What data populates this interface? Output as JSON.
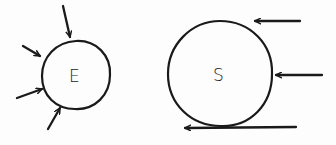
{
  "diagram": {
    "nodes": [
      {
        "id": "E",
        "label": "E",
        "cx": 76,
        "cy": 75,
        "r": 34,
        "incoming_arrows": 4,
        "arrow_direction": "inward from various directions (top, upper-left, left, lower-left)"
      },
      {
        "id": "S",
        "label": "S",
        "cx": 220,
        "cy": 74,
        "r": 52,
        "incoming_arrows": 3,
        "arrow_direction": "from the right, leftward"
      }
    ],
    "arrows": [
      {
        "target": "E",
        "x1": 63,
        "y1": 6,
        "x2": 70,
        "y2": 37
      },
      {
        "target": "E",
        "x1": 23,
        "y1": 46,
        "x2": 40,
        "y2": 56
      },
      {
        "target": "E",
        "x1": 17,
        "y1": 98,
        "x2": 42,
        "y2": 89
      },
      {
        "target": "E",
        "x1": 48,
        "y1": 129,
        "x2": 60,
        "y2": 108
      },
      {
        "target": "S",
        "x1": 300,
        "y1": 21,
        "x2": 255,
        "y2": 21
      },
      {
        "target": "S",
        "x1": 322,
        "y1": 75,
        "x2": 276,
        "y2": 75
      },
      {
        "target": "S",
        "x1": 296,
        "y1": 127,
        "x2": 185,
        "y2": 128
      }
    ]
  }
}
